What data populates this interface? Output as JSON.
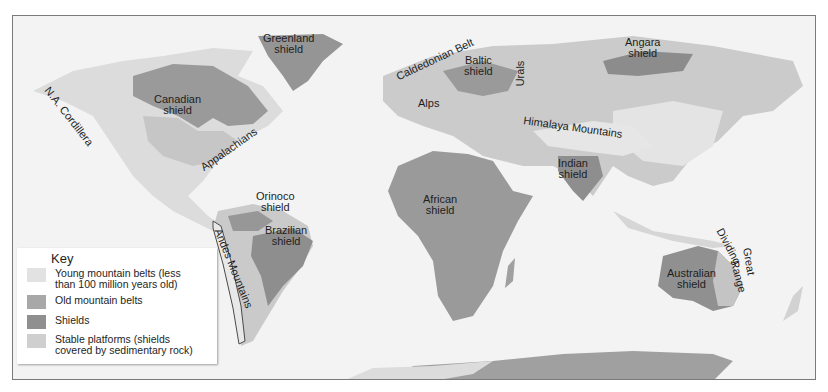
{
  "map": {
    "title": "World map of tectonic features: shields, stable platforms, old and young mountain belts",
    "colors": {
      "ocean": "#f3f3f3",
      "young_mountains": "#e4e4e4",
      "old_mountains": "#a4a4a4",
      "shields": "#8e8e8e",
      "stable_platforms": "#c9c9c9",
      "frame_border": "#7a7a7a"
    },
    "labels": {
      "greenland_shield": "Greenland\nshield",
      "canadian_shield": "Canadian\nshield",
      "na_cordillera": "N.A. Cordillera",
      "appalachians": "Appalachians",
      "caledonian_belt": "Caldedonian Belt",
      "baltic_shield": "Baltic\nshield",
      "alps": "Alps",
      "urals": "Urals",
      "angara_shield": "Angara\nshield",
      "himalaya_mountains": "Himalaya Mountains",
      "indian_shield": "Indian\nshield",
      "african_shield": "African\nshield",
      "orinoco_shield": "Orinoco\nshield",
      "brazilian_shield": "Brazilian\nshield",
      "andes_mountains": "Andes Mountains",
      "australian_shield": "Australian\nshield",
      "great_dividing_range_1": "Dividing",
      "great_dividing_range_2": "Great",
      "great_dividing_range_3": "Range"
    }
  },
  "legend": {
    "title": "Key",
    "items": [
      {
        "label": "Young mountain belts (less than 100 million years old)",
        "line1": "Young mountain belts (less",
        "line2": "than 100 million years old)",
        "color": "#e2e2e2"
      },
      {
        "label": "Old mountain belts",
        "line1": "Old mountain belts",
        "line2": "",
        "color": "#a8a8a8"
      },
      {
        "label": "Shields",
        "line1": "Shields",
        "line2": "",
        "color": "#8f8f8f"
      },
      {
        "label": "Stable platforms (shields covered by sedimentary rock)",
        "line1": "Stable platforms (shields",
        "line2": "covered by sedimentary rock)",
        "color": "#cfcfcf"
      }
    ]
  }
}
